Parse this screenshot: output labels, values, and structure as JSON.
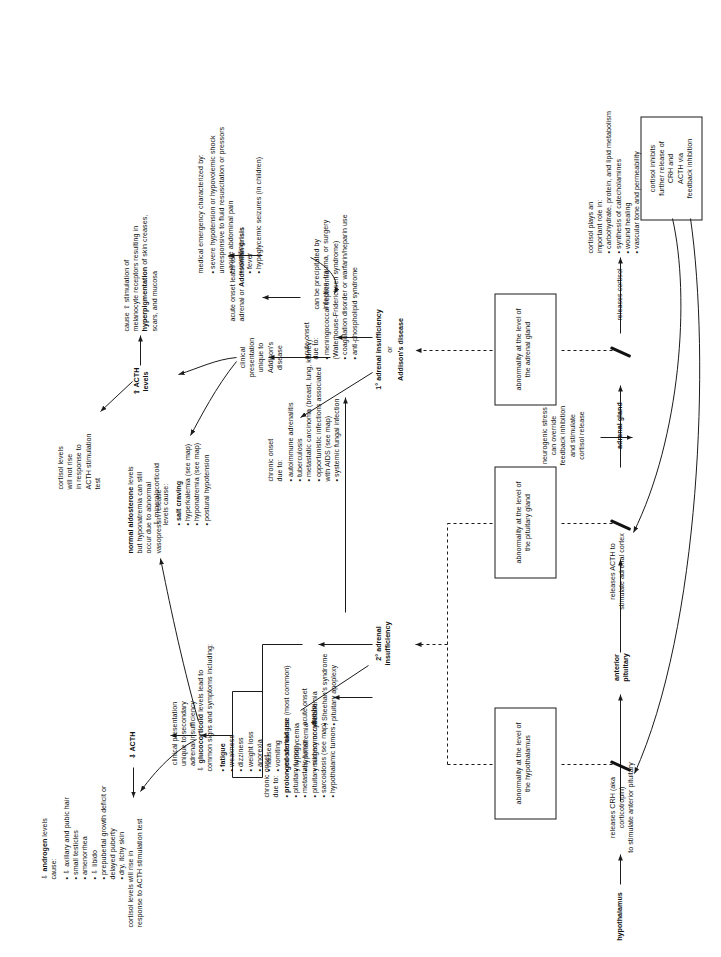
{
  "diagram": {
    "accent": "#1b1b1b"
  },
  "axis": {
    "hypothalamus": "hypothalamus",
    "crh_step": "releases CRH (aka corticotropin)\nto stimulate anterior pituitary",
    "anterior_pituitary": "anterior\npituitary",
    "acth_step": "releases ACTH to\nstimulate adrenal cortex",
    "adrenal_gland": "adrenal gland",
    "cortisol_step": "releases cortisol",
    "neurogenic": "neurogenic stress\ncan override\nfeedback inhibition\nand stimulate\ncortisol release",
    "cortisol_roles": "cortisol plays an\nimportant role in:\n• carbohydrate, protein, and lipid metabolism\n• synthesis of catecholamines\n• wound healing\n• vascular tone and permeability",
    "feedback_box": "cortisol inhibits\nfurther release of\nCRH and\nACTH via\nfeedback inhibition"
  },
  "lesion_boxes": {
    "hypothalamus_box": "abnormality at the level of\nthe hypothalamus",
    "pituitary_box": "abnormality at the level of\nthe pituitary gland",
    "adrenal_box": "abnormality at the level of\nthe adrenal gland"
  },
  "secondary": {
    "label": "2° adrenal\ninsufficiency",
    "acute_onset_heading": "acute onset\ndue to:",
    "acute_onset_items": [
      "Sheehan's syndrome",
      "pituitary apoplexy"
    ],
    "chronic_onset_heading": "chronic onset\ndue to:",
    "chronic_onset_items": [
      "prolonged steroid use (most common)",
      "pituitary tumor",
      "metastatic tumor",
      "pituitary surgery or radiation",
      "sarcoidosis (see map)",
      "hypothalamic tumors"
    ],
    "chronic_first_bold": "prolonged steroid use"
  },
  "glucocorticoid": {
    "heading": "⇩ glucocorticoid levels lead to\ncommon signs and symptoms including:",
    "heading_bold": "glucocorticoid",
    "items": [
      "fatigue",
      "weakness",
      "dizziness",
      "weight loss",
      "anorexia",
      "nausea",
      "vomiting",
      "mood changes",
      "hypoglycemia",
      "hyponatremia",
      "mild normocytic anemia"
    ],
    "first_bold": "fatigue"
  },
  "primary": {
    "label_line1": "1° adrenal insufficiency",
    "label_line2": "or",
    "label_line3": "Addison's disease",
    "chronic_onset_heading": "chronic onset\ndue to:",
    "chronic_onset_items": [
      "autoimmune adrenalitis",
      "tuberculosis",
      "metastatic carcinoma (breast, lung, kidney)",
      "opportunistic infections associated\n  with AIDS (see map)",
      "systemic fungal infection"
    ],
    "acute_onset_heading": "acute onset\ndue to:",
    "acute_onset_items": [
      "meningococcal septicemia\n  (Waterhouse-Friderichsen syndrome)",
      "coagulation disorder or warfarin/heparin use",
      "anti-phospholipid syndrome"
    ],
    "crisis_link": "acute onset leads to\nadrenal or Addisonian crisis",
    "crisis_link_bold": "Addisonian crisis",
    "crisis_desc": "medical emergency characterized by:",
    "crisis_items": [
      "severe hypotension or hypovolemic shock\n  unresponsive to fluid resuscitation or pressors",
      "acute abdominal pain",
      "vomiting",
      "fever",
      "hypoglycemic seizures (in children)"
    ],
    "precipitated": "can be precipitated by\ninfection, trauma, or surgery"
  },
  "clinical_secondary": {
    "heading": "clinical presentation\nunique to secondary\nadrenal insufficiency",
    "androgen_heading": "⇩ androgen levels\ncause:",
    "androgen_bold": "androgen",
    "androgen_items": [
      "⇩ axillary and pubic hair",
      "small testicles",
      "amenorrhea",
      "⇩ libido",
      "prepubertal growth deficit or\n  delayed puberty",
      "dry, itchy skin"
    ],
    "acth_low": "⇩ ACTH",
    "cortisol_rise": "cortisol levels will rise in\nresponse to ACTH stimulation test",
    "aldosterone": "normal aldosterone levels\nbut hyponatremia can still\noccur due to abnormal\nvasopressin release",
    "aldosterone_bold": "normal aldosterone"
  },
  "clinical_primary": {
    "heading": "clinical\npresentation\nunique to\nAddison's\ndisease",
    "mineralocorticoid_heading": "⇩ mineralocorticoid\nlevels cause:",
    "mineralocorticoid_items": [
      "salt craving",
      "hyperkalemia (see map)",
      "hyponatremia (see map)",
      "postural hypotension"
    ],
    "mineralocorticoid_first_bold": "salt craving",
    "acth_high": "⇧ ACTH\nlevels",
    "cortisol_no_rise": "cortisol levels\nwill not rise\nin response to\nACTH stimulation\ntest",
    "melanocyte": "cause ⇧ stimulation of\nmelanocyte receptors resulting in\nhyperpigmentation of skin creases,\nscars, and mucosa",
    "melanocyte_bold": "hyperpigmentation"
  }
}
